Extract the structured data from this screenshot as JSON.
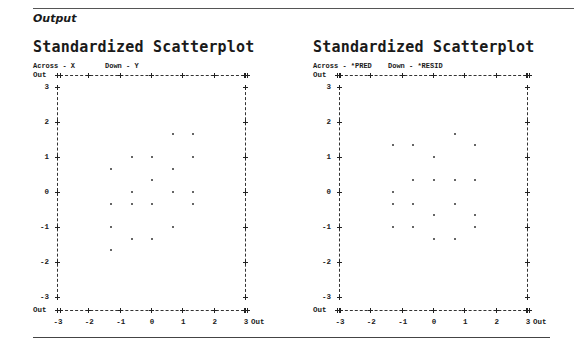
{
  "section_label": "Output",
  "chart_data": [
    {
      "type": "scatter",
      "title": "Standardized Scatterplot",
      "across_label": "Across - X",
      "down_label": "Down - Y",
      "xlabel": "X",
      "ylabel": "Y",
      "xlim": [
        -3,
        3
      ],
      "ylim": [
        -3,
        3
      ],
      "x_ticks": [
        "-3",
        "-2",
        "-1",
        "0",
        "1",
        "2",
        "3"
      ],
      "y_ticks": [
        "3",
        "2",
        "1",
        "0",
        "-1",
        "-2",
        "-3"
      ],
      "out_label": "Out",
      "grid": false,
      "points": [
        {
          "x": 0.7,
          "y": 1.67
        },
        {
          "x": 1.35,
          "y": 1.67
        },
        {
          "x": -0.6,
          "y": 1.0
        },
        {
          "x": 0.03,
          "y": 1.0
        },
        {
          "x": 1.35,
          "y": 1.0
        },
        {
          "x": -1.27,
          "y": 0.67
        },
        {
          "x": 0.7,
          "y": 0.67
        },
        {
          "x": 0.03,
          "y": 0.33
        },
        {
          "x": -0.6,
          "y": 0.0
        },
        {
          "x": 0.7,
          "y": 0.0
        },
        {
          "x": 1.35,
          "y": 0.0
        },
        {
          "x": -1.27,
          "y": -0.33
        },
        {
          "x": -0.6,
          "y": -0.33
        },
        {
          "x": 0.03,
          "y": -0.33
        },
        {
          "x": 1.35,
          "y": -0.33
        },
        {
          "x": -1.27,
          "y": -1.0
        },
        {
          "x": 0.7,
          "y": -1.0
        },
        {
          "x": -0.6,
          "y": -1.33
        },
        {
          "x": 0.03,
          "y": -1.33
        },
        {
          "x": -1.27,
          "y": -1.67
        }
      ]
    },
    {
      "type": "scatter",
      "title": "Standardized Scatterplot",
      "across_label": "Across - *PRED",
      "down_label": "Down - *RESID",
      "xlabel": "*PRED",
      "ylabel": "*RESID",
      "xlim": [
        -3,
        3
      ],
      "ylim": [
        -3,
        3
      ],
      "x_ticks": [
        "-3",
        "-2",
        "-1",
        "0",
        "1",
        "2",
        "3"
      ],
      "y_ticks": [
        "3",
        "2",
        "1",
        "0",
        "-1",
        "-2",
        "-3"
      ],
      "out_label": "Out",
      "grid": false,
      "points": [
        {
          "x": 0.71,
          "y": 1.67
        },
        {
          "x": -1.29,
          "y": 1.33
        },
        {
          "x": -0.65,
          "y": 1.33
        },
        {
          "x": 1.35,
          "y": 1.33
        },
        {
          "x": 0.03,
          "y": 1.0
        },
        {
          "x": -0.65,
          "y": 0.33
        },
        {
          "x": 0.03,
          "y": 0.33
        },
        {
          "x": 0.71,
          "y": 0.33
        },
        {
          "x": 1.35,
          "y": 0.33
        },
        {
          "x": -1.29,
          "y": 0.0
        },
        {
          "x": -1.29,
          "y": -0.33
        },
        {
          "x": -0.65,
          "y": -0.33
        },
        {
          "x": 0.71,
          "y": -0.33
        },
        {
          "x": 0.03,
          "y": -0.67
        },
        {
          "x": 1.35,
          "y": -0.67
        },
        {
          "x": -1.29,
          "y": -1.0
        },
        {
          "x": -0.65,
          "y": -1.0
        },
        {
          "x": 1.35,
          "y": -1.0
        },
        {
          "x": 0.03,
          "y": -1.33
        },
        {
          "x": 0.71,
          "y": -1.33
        }
      ]
    }
  ]
}
